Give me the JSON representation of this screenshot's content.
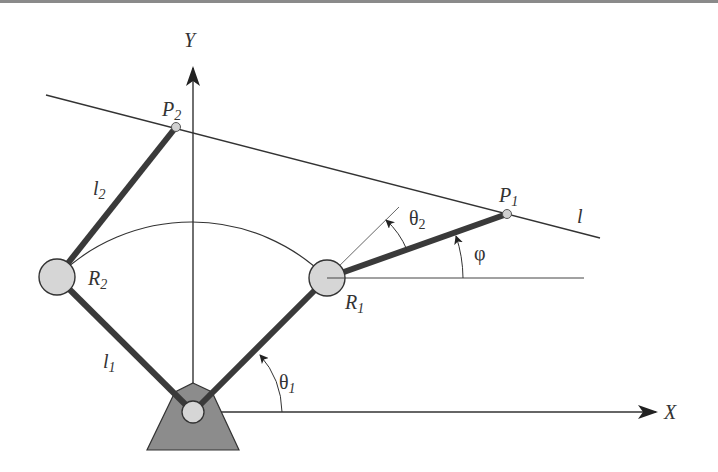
{
  "figure": {
    "colors": {
      "link": "#3a3a3a",
      "thin_line": "#333333",
      "joint_fill": "#d6d6d6",
      "joint_stroke": "#333333",
      "base_fill": "#8c8c8c",
      "top_bar": "#8a8a8a"
    },
    "axes": {
      "x_label": "X",
      "y_label": "Y"
    },
    "labels": {
      "P1": {
        "main": "P",
        "sub": "1"
      },
      "P2": {
        "main": "P",
        "sub": "2"
      },
      "R1": {
        "main": "R",
        "sub": "1"
      },
      "R2": {
        "main": "R",
        "sub": "2"
      },
      "l1": {
        "main": "l",
        "sub": "1"
      },
      "l2": {
        "main": "l",
        "sub": "2"
      },
      "line": "l",
      "theta1": {
        "main": "θ",
        "sub": "1"
      },
      "theta2": {
        "main": "θ",
        "sub": "2"
      },
      "phi": "φ"
    },
    "points": {
      "origin": [
        193,
        412
      ],
      "R1": [
        327,
        278
      ],
      "R2": [
        57,
        277
      ],
      "P1": [
        507,
        214
      ],
      "P2": [
        176,
        127
      ]
    }
  }
}
